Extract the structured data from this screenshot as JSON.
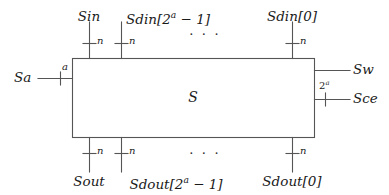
{
  "figure": {
    "type": "block-diagram",
    "block_label": "S",
    "line_color": "#555555",
    "text_color": "#1a1a1a",
    "background_color": "#ffffff",
    "ellipsis": "· · ·"
  },
  "block": {
    "label": "S",
    "x": 72,
    "y": 58,
    "width": 243,
    "height": 80
  },
  "ports": {
    "top": [
      {
        "name": "Sin",
        "label": "Sin",
        "width_label": "n",
        "x": 89,
        "direction": "input"
      },
      {
        "name": "Sdin-high",
        "label_base": "Sdin[2",
        "label_sup": "a",
        "label_tail": " − 1]",
        "label": "Sdin[2a − 1]",
        "width_label": "n",
        "x": 121,
        "direction": "input"
      },
      {
        "name": "Sdin-zero",
        "label": "Sdin[0]",
        "width_label": "n",
        "x": 292,
        "direction": "input"
      }
    ],
    "bottom": [
      {
        "name": "Sout",
        "label": "Sout",
        "width_label": "n",
        "x": 89,
        "direction": "output"
      },
      {
        "name": "Sdout-high",
        "label_base": "Sdout[2",
        "label_sup": "a",
        "label_tail": " − 1]",
        "label": "Sdout[2a − 1]",
        "width_label": "n",
        "x": 121,
        "direction": "output"
      },
      {
        "name": "Sdout-zero",
        "label": "Sdout[0]",
        "width_label": "n",
        "x": 292,
        "direction": "output"
      }
    ],
    "left": [
      {
        "name": "Sa",
        "label": "Sa",
        "width_label": "a",
        "y": 78,
        "direction": "input"
      }
    ],
    "right": [
      {
        "name": "Sw",
        "label": "Sw",
        "width_label": "",
        "y": 70,
        "direction": "input"
      },
      {
        "name": "Sce",
        "label": "Sce",
        "width_label_base": "2",
        "width_label_sup": "a",
        "width_label": "2a",
        "y": 99,
        "direction": "input"
      }
    ]
  },
  "ellipses": [
    {
      "name": "top-ellipsis",
      "x": 205,
      "y": 33
    },
    {
      "name": "bottom-ellipsis",
      "x": 205,
      "y": 152
    }
  ]
}
